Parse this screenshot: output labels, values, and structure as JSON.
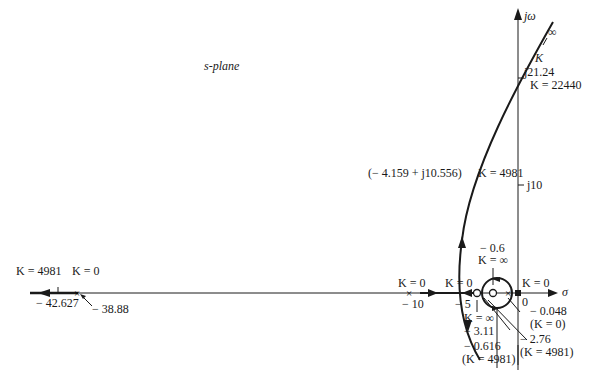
{
  "diagram": {
    "type": "root-locus",
    "plane_label": "s-plane",
    "axes": {
      "imag_label": "jω",
      "real_label": "σ"
    },
    "imag_ticks": [
      "j10",
      "j21.24"
    ],
    "labels": {
      "infinity_top": "∞",
      "k_top": "K",
      "crossing_j": "j21.24",
      "crossing_k": "K = 22440",
      "point_complex": "(− 4.159 + j10.556)",
      "point_complex_k": "K = 4981",
      "j10": "j10",
      "far_left_k4981": "K = 4981",
      "far_left_k0": "K = 0",
      "far_left_breakaway": "− 42.627",
      "far_left_pole": "− 38.88",
      "pole10_k": "K = 0",
      "pole10_val": "− 10",
      "pole5_k": "K = 0",
      "pole5_val": "− 5",
      "origin_k": "K = 0",
      "origin_val": "0",
      "zero06_val": "− 0.6",
      "zero06_k": "K = ∞",
      "zero311_k": "K = ∞",
      "zero311_val": "− 3.11",
      "p0048_val": "− 0.048",
      "p0048_k": "(K = 0)",
      "p276_val": "− 2.76",
      "p276_k": "(K = 4981)",
      "p0616_val": "− 0.616",
      "p0616_k": "(K = 4981)"
    }
  }
}
